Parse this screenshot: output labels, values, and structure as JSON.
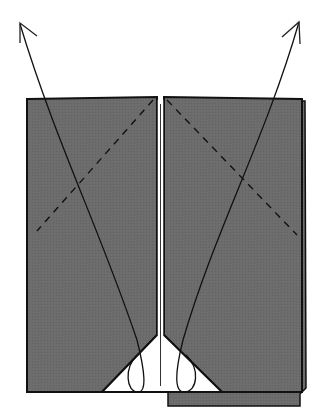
{
  "diagram": {
    "type": "origami-fold-step",
    "colors": {
      "paper_color": "#6b6b6b",
      "paper_back": "#ffffff",
      "outline": "#111111",
      "background": "#ffffff"
    },
    "panels": [
      {
        "name": "left-flap",
        "x": 27,
        "y": 98,
        "width": 130,
        "height": 315
      },
      {
        "name": "right-flap",
        "x": 164,
        "y": 97,
        "width": 136,
        "height": 316
      }
    ],
    "arrows": [
      {
        "name": "left-unfold-arrow",
        "direction": "up-left",
        "tip": [
          20,
          23
        ]
      },
      {
        "name": "right-unfold-arrow",
        "direction": "up-right",
        "tip": [
          299,
          21
        ]
      }
    ],
    "fold_lines": [
      {
        "name": "left-valley-fold",
        "style": "dashed"
      },
      {
        "name": "right-valley-fold",
        "style": "dashed"
      }
    ]
  }
}
